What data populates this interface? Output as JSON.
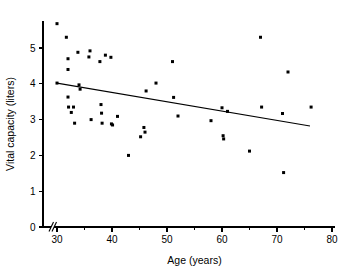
{
  "chart_data": {
    "type": "scatter",
    "title": "",
    "subtitle": "",
    "xlabel": "Age (years)",
    "ylabel": "Vital capacity (liters)",
    "xlim": [
      30,
      80
    ],
    "ylim": [
      0,
      5.8
    ],
    "x_ticks": [
      30,
      40,
      50,
      60,
      70,
      80
    ],
    "x_tick_labels": [
      "30",
      "40",
      "50",
      "60",
      "70",
      "80"
    ],
    "y_ticks": [
      0,
      1,
      2,
      3,
      4,
      5
    ],
    "y_tick_labels": [
      "0",
      "1",
      "2",
      "3",
      "4",
      "5"
    ],
    "grid": false,
    "legend": false,
    "axis_break": {
      "axis": "x",
      "present": true,
      "note": "slash break between origin and first tick"
    },
    "series": [
      {
        "name": "Subjects",
        "marker": "filled-square",
        "marker_color": "#000000",
        "points": [
          [
            30.0,
            5.68
          ],
          [
            30.0,
            4.02
          ],
          [
            31.7,
            5.3
          ],
          [
            32.0,
            4.7
          ],
          [
            32.0,
            3.63
          ],
          [
            32.0,
            4.4
          ],
          [
            32.1,
            3.35
          ],
          [
            32.6,
            3.2
          ],
          [
            33.0,
            3.35
          ],
          [
            33.2,
            2.9
          ],
          [
            33.8,
            4.88
          ],
          [
            34.0,
            3.97
          ],
          [
            34.2,
            3.85
          ],
          [
            35.8,
            4.75
          ],
          [
            36.0,
            4.92
          ],
          [
            36.2,
            3.0
          ],
          [
            37.8,
            4.62
          ],
          [
            38.0,
            3.42
          ],
          [
            38.1,
            3.18
          ],
          [
            38.2,
            2.9
          ],
          [
            38.8,
            4.8
          ],
          [
            39.8,
            4.74
          ],
          [
            39.9,
            2.88
          ],
          [
            40.1,
            2.85
          ],
          [
            41.0,
            3.09
          ],
          [
            43.0,
            2.0
          ],
          [
            45.2,
            2.52
          ],
          [
            45.8,
            2.78
          ],
          [
            46.0,
            2.65
          ],
          [
            46.2,
            3.8
          ],
          [
            48.0,
            4.02
          ],
          [
            51.0,
            4.62
          ],
          [
            51.2,
            3.62
          ],
          [
            52.0,
            3.1
          ],
          [
            58.0,
            2.97
          ],
          [
            60.0,
            3.33
          ],
          [
            60.2,
            2.55
          ],
          [
            60.3,
            2.46
          ],
          [
            61.0,
            3.23
          ],
          [
            65.0,
            2.12
          ],
          [
            67.0,
            5.3
          ],
          [
            67.2,
            3.35
          ],
          [
            71.0,
            3.17
          ],
          [
            71.2,
            1.52
          ],
          [
            72.0,
            4.33
          ],
          [
            76.2,
            3.35
          ]
        ]
      }
    ],
    "fit_line": {
      "name": "Least-squares regression line",
      "x_start": 30.0,
      "y_start": 4.02,
      "x_end": 76.0,
      "y_end": 2.82,
      "color": "#000000"
    }
  }
}
